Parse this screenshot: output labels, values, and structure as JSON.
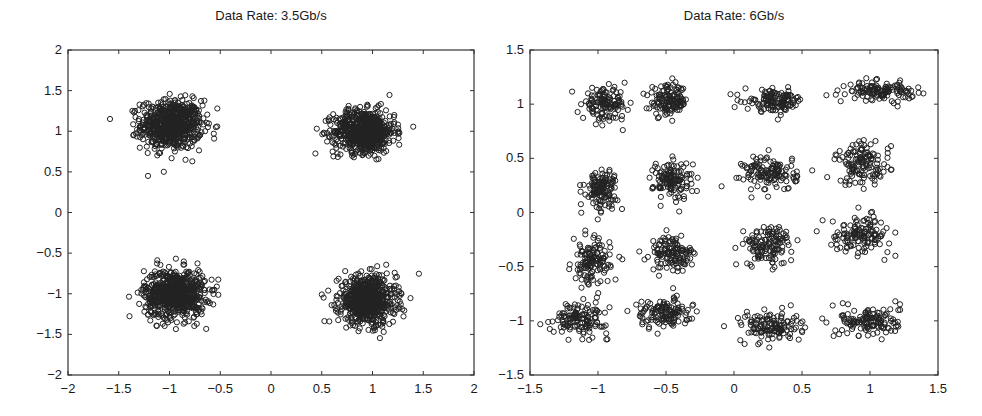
{
  "chart_data": [
    {
      "type": "scatter",
      "title": "Data Rate: 3.5Gb/s",
      "xlabel": "",
      "ylabel": "",
      "xlim": [
        -2,
        2
      ],
      "ylim": [
        -2,
        2
      ],
      "xticks": [
        "-2",
        "-1.5",
        "-1",
        "-0.5",
        "0",
        "0.5",
        "1",
        "1.5",
        "2"
      ],
      "yticks": [
        "2",
        "1.5",
        "1",
        "0.5",
        "0",
        "-0.5",
        "-1",
        "-1.5",
        "-2"
      ],
      "xtick_values": [
        -2,
        -1.5,
        -1,
        -0.5,
        0,
        0.5,
        1,
        1.5,
        2
      ],
      "ytick_values": [
        2,
        1.5,
        1,
        0.5,
        0,
        -0.5,
        -1,
        -1.5,
        -2
      ],
      "grid": false,
      "legend": null,
      "marker": "open-circle",
      "marker_color": "#222222",
      "clusters": [
        {
          "cx": -0.98,
          "cy": 1.08,
          "sx": 0.15,
          "sy": 0.15,
          "n": 700
        },
        {
          "cx": 0.92,
          "cy": 1.0,
          "sx": 0.15,
          "sy": 0.13,
          "n": 700
        },
        {
          "cx": -0.95,
          "cy": -1.0,
          "sx": 0.15,
          "sy": 0.15,
          "n": 700
        },
        {
          "cx": 0.95,
          "cy": -1.08,
          "sx": 0.14,
          "sy": 0.15,
          "n": 700
        }
      ]
    },
    {
      "type": "scatter",
      "title": "Data Rate: 6Gb/s",
      "xlabel": "",
      "ylabel": "",
      "xlim": [
        -1.5,
        1.5
      ],
      "ylim": [
        -1.5,
        1.5
      ],
      "xticks": [
        "-1.5",
        "-1",
        "-0.5",
        "0",
        "0.5",
        "1",
        "1.5"
      ],
      "yticks": [
        "1.5",
        "1",
        "0.5",
        "0",
        "-0.5",
        "-1",
        "-1.5"
      ],
      "xtick_values": [
        -1.5,
        -1,
        -0.5,
        0,
        0.5,
        1,
        1.5
      ],
      "ytick_values": [
        1.5,
        1,
        0.5,
        0,
        -0.5,
        -1,
        -1.5
      ],
      "grid": false,
      "legend": null,
      "marker": "open-circle",
      "marker_color": "#222222",
      "clusters": [
        {
          "cx": -0.95,
          "cy": 1.0,
          "sx": 0.08,
          "sy": 0.07,
          "n": 130
        },
        {
          "cx": -0.48,
          "cy": 1.03,
          "sx": 0.07,
          "sy": 0.07,
          "n": 130
        },
        {
          "cx": 0.3,
          "cy": 1.03,
          "sx": 0.11,
          "sy": 0.05,
          "n": 130
        },
        {
          "cx": 1.08,
          "cy": 1.12,
          "sx": 0.12,
          "sy": 0.04,
          "n": 130
        },
        {
          "cx": -0.98,
          "cy": 0.22,
          "sx": 0.06,
          "sy": 0.09,
          "n": 130
        },
        {
          "cx": -0.45,
          "cy": 0.3,
          "sx": 0.07,
          "sy": 0.09,
          "n": 130
        },
        {
          "cx": 0.27,
          "cy": 0.36,
          "sx": 0.1,
          "sy": 0.08,
          "n": 130
        },
        {
          "cx": 0.95,
          "cy": 0.45,
          "sx": 0.1,
          "sy": 0.1,
          "n": 130
        },
        {
          "cx": -1.05,
          "cy": -0.47,
          "sx": 0.07,
          "sy": 0.11,
          "n": 130
        },
        {
          "cx": -0.45,
          "cy": -0.38,
          "sx": 0.08,
          "sy": 0.08,
          "n": 130
        },
        {
          "cx": 0.25,
          "cy": -0.3,
          "sx": 0.09,
          "sy": 0.09,
          "n": 130
        },
        {
          "cx": 0.93,
          "cy": -0.2,
          "sx": 0.11,
          "sy": 0.08,
          "n": 130
        },
        {
          "cx": -1.13,
          "cy": -0.98,
          "sx": 0.1,
          "sy": 0.07,
          "n": 130
        },
        {
          "cx": -0.52,
          "cy": -0.93,
          "sx": 0.1,
          "sy": 0.07,
          "n": 130
        },
        {
          "cx": 0.27,
          "cy": -1.05,
          "sx": 0.11,
          "sy": 0.07,
          "n": 130
        },
        {
          "cx": 1.0,
          "cy": -1.0,
          "sx": 0.11,
          "sy": 0.07,
          "n": 130
        }
      ]
    }
  ],
  "plots": [
    {
      "title": "Data Rate: 3.5Gb/s"
    },
    {
      "title": "Data Rate: 6Gb/s"
    }
  ]
}
